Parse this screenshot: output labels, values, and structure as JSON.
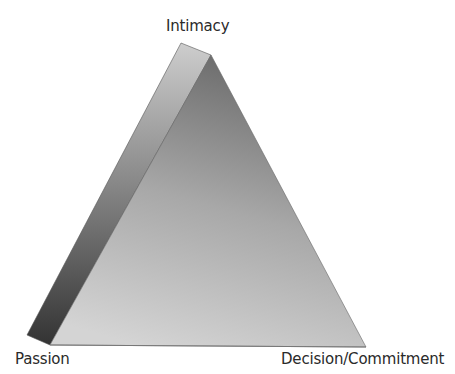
{
  "diagram": {
    "type": "triangle",
    "title": "",
    "vertices": {
      "top": "Intimacy",
      "bottom_left": "Passion",
      "bottom_right": "Decision/Commitment"
    },
    "colors": {
      "side_face_light": "#c8c8c8",
      "side_face_dark": "#3a3a3a",
      "front_face_top": "#707070",
      "front_face_bottom": "#cfcfcf",
      "label_text": "#2a2a2a"
    }
  }
}
